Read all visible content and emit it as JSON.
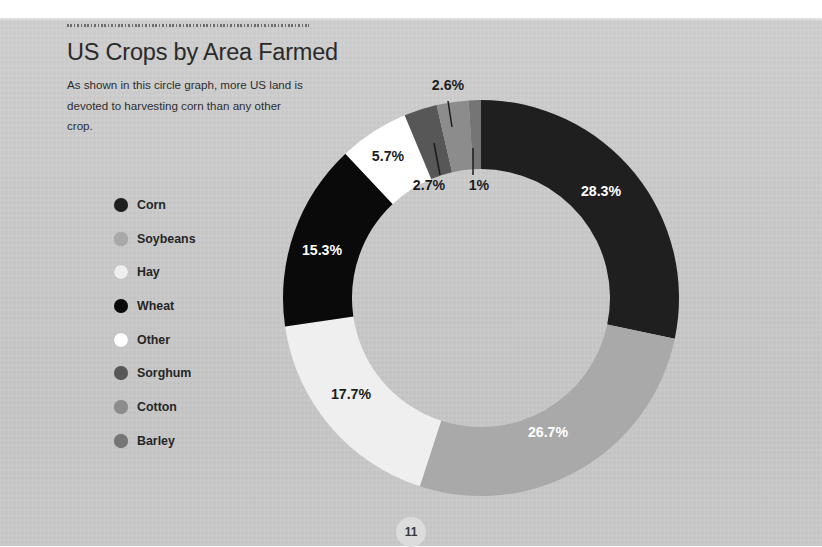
{
  "page": {
    "number": "11",
    "background_color": "#c8c8c8",
    "top_strip_color": "#ffffff"
  },
  "header": {
    "title": "US Crops by Area Farmed",
    "subtitle": "As shown in this circle graph, more US land is devoted to harvesting corn than any other crop.",
    "rule": "dotted-rule"
  },
  "legend": {
    "items": [
      {
        "label": "Corn",
        "color": "#1f1f1f"
      },
      {
        "label": "Soybeans",
        "color": "#a9a9a9"
      },
      {
        "label": "Hay",
        "color": "#efefef"
      },
      {
        "label": "Wheat",
        "color": "#0a0a0a"
      },
      {
        "label": "Other",
        "color": "#ffffff"
      },
      {
        "label": "Sorghum",
        "color": "#575757"
      },
      {
        "label": "Cotton",
        "color": "#8c8c8c"
      },
      {
        "label": "Barley",
        "color": "#757575"
      }
    ]
  },
  "chart_data": {
    "type": "pie",
    "variant": "donut",
    "title": "US Crops by Area Farmed",
    "subtitle": "As shown in this circle graph, more US land is devoted to harvesting corn than any other crop.",
    "unit": "percent",
    "start_angle_deg": 0,
    "direction": "clockwise",
    "center": {
      "x": 481,
      "y": 298
    },
    "outer_radius": 198,
    "inner_radius": 129,
    "legend_position": "left",
    "grid": false,
    "categories": [
      "Corn",
      "Soybeans",
      "Hay",
      "Wheat",
      "Other",
      "Sorghum",
      "Cotton",
      "Barley"
    ],
    "values": [
      28.3,
      26.7,
      17.7,
      15.3,
      5.7,
      2.7,
      2.6,
      1.0
    ],
    "labels": [
      "28.3%",
      "26.7%",
      "17.7%",
      "15.3%",
      "5.7%",
      "2.7%",
      "2.6%",
      "1%"
    ],
    "colors": [
      "#1f1f1f",
      "#a9a9a9",
      "#efefef",
      "#0a0a0a",
      "#ffffff",
      "#575757",
      "#8c8c8c",
      "#757575"
    ],
    "slices": [
      {
        "name": "Corn",
        "value": 28.3,
        "label": "28.3%",
        "color": "#1f1f1f",
        "label_color": "light",
        "label_placement": "inside",
        "label_x": 601,
        "label_y": 196
      },
      {
        "name": "Soybeans",
        "value": 26.7,
        "label": "26.7%",
        "color": "#a9a9a9",
        "label_color": "light",
        "label_placement": "inside",
        "label_x": 548,
        "label_y": 437
      },
      {
        "name": "Hay",
        "value": 17.7,
        "label": "17.7%",
        "color": "#efefef",
        "label_color": "dark",
        "label_placement": "inside",
        "label_x": 351,
        "label_y": 399
      },
      {
        "name": "Wheat",
        "value": 15.3,
        "label": "15.3%",
        "color": "#0a0a0a",
        "label_color": "light",
        "label_placement": "inside",
        "label_x": 322,
        "label_y": 255
      },
      {
        "name": "Other",
        "value": 5.7,
        "label": "5.7%",
        "color": "#ffffff",
        "label_color": "dark",
        "label_placement": "inside",
        "label_x": 388,
        "label_y": 161
      },
      {
        "name": "Sorghum",
        "value": 2.7,
        "label": "2.7%",
        "color": "#575757",
        "label_color": "dark",
        "label_placement": "outside",
        "label_x": 429,
        "label_y": 190,
        "leader": {
          "x1": 434,
          "y1": 143,
          "x2": 440,
          "y2": 175
        }
      },
      {
        "name": "Cotton",
        "value": 2.6,
        "label": "2.6%",
        "color": "#8c8c8c",
        "label_color": "dark",
        "label_placement": "outside",
        "label_x": 448,
        "label_y": 90,
        "leader": {
          "x1": 448,
          "y1": 101,
          "x2": 452,
          "y2": 127
        }
      },
      {
        "name": "Barley",
        "value": 1.0,
        "label": "1%",
        "color": "#757575",
        "label_color": "dark",
        "label_placement": "outside",
        "label_x": 479,
        "label_y": 190,
        "leader": {
          "x1": 473,
          "y1": 148,
          "x2": 473,
          "y2": 175
        }
      }
    ]
  }
}
